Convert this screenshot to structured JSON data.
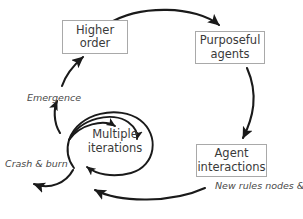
{
  "diagram": {
    "nodes": [
      {
        "id": "higher-order",
        "line1": "Higher",
        "line2": "order"
      },
      {
        "id": "purposeful",
        "line1": "Purposeful",
        "line2": "agents"
      },
      {
        "id": "agent",
        "line1": "Agent",
        "line2": "interactions"
      },
      {
        "id": "multiple",
        "line1": "Multiple",
        "line2": "iterations"
      }
    ],
    "edge_labels": {
      "emergence": "Emergence",
      "crash_and_burn": "Crash & burn",
      "new_rules_line1": "New  rules",
      "new_rules_line2": "nodes & networks"
    },
    "bottom_clipped_text": "",
    "colors": {
      "stroke": "#1a1a1a",
      "box_border": "#a9a9a9",
      "box_fill": "#ffffff",
      "text": "#3a3a3a",
      "label_text": "#4a4a4a",
      "background": "#ffffff"
    }
  }
}
